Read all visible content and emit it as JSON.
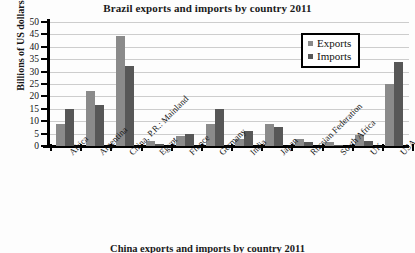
{
  "chart_data": {
    "type": "bar",
    "title": "Brazil exports and imports by country 2011",
    "xlabel": "",
    "ylabel": "Billions of US dollars",
    "ylim": [
      0,
      50
    ],
    "ytick_step": 5,
    "yticks": [
      "0",
      "5",
      "10",
      "15",
      "20",
      "25",
      "30",
      "35",
      "40",
      "45",
      "50"
    ],
    "grid": true,
    "legend_position": "top-right",
    "categories": [
      "Africa",
      "Argentina",
      "China, P.R.: Mainland",
      "Egypt",
      "France",
      "Germany",
      "India",
      "Japan",
      "Russian Federation",
      "South Africa",
      "UK",
      "USA"
    ],
    "series": [
      {
        "name": "Exports",
        "color": "#8a8a8a",
        "values": [
          9,
          22.2,
          44.2,
          2,
          4,
          9,
          3,
          9,
          3,
          1.5,
          4.5,
          25.2
        ]
      },
      {
        "name": "Imports",
        "color": "#575757",
        "values": [
          15,
          16.7,
          32.4,
          0.8,
          5,
          15,
          6,
          7.5,
          1.5,
          0.5,
          2,
          33.8
        ]
      }
    ]
  },
  "legend": {
    "items": [
      {
        "label": "Exports",
        "color": "#8a8a8a"
      },
      {
        "label": "Imports",
        "color": "#575757"
      }
    ]
  },
  "bottom_caption": "China exports and imports by country 2011"
}
